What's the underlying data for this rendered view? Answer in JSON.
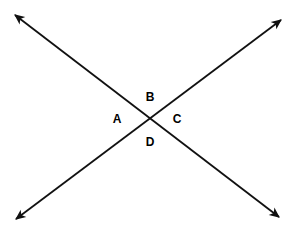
{
  "canvas": {
    "width": 296,
    "height": 237,
    "background_color": "#ffffff"
  },
  "figure": {
    "stroke_color": "#111111",
    "stroke_width": 1.8,
    "intersection": {
      "x": 148,
      "y": 117
    },
    "lines": [
      {
        "id": "line-falling",
        "name": "line-top-left-to-bottom-right",
        "from": {
          "x": 15,
          "y": 15
        },
        "to": {
          "x": 279,
          "y": 217
        },
        "arrowhead_start": true,
        "arrowhead_end": true
      },
      {
        "id": "line-rising",
        "name": "line-bottom-left-to-top-right",
        "from": {
          "x": 16,
          "y": 219
        },
        "to": {
          "x": 281,
          "y": 20
        },
        "arrowhead_start": true,
        "arrowhead_end": true
      }
    ],
    "arrow_tips": [
      {
        "name": "arrow-tip-top-left",
        "x": 15,
        "y": 15
      },
      {
        "name": "arrow-tip-top-right",
        "x": 281,
        "y": 20
      },
      {
        "name": "arrow-tip-bottom-left",
        "x": 16,
        "y": 219
      },
      {
        "name": "arrow-tip-bottom-right",
        "x": 279,
        "y": 217
      }
    ],
    "labels": [
      {
        "id": "A",
        "text": "A",
        "x": 117,
        "y": 119,
        "position": "left-angle"
      },
      {
        "id": "B",
        "text": "B",
        "x": 150,
        "y": 97,
        "position": "top-angle"
      },
      {
        "id": "C",
        "text": "C",
        "x": 177,
        "y": 119,
        "position": "right-angle"
      },
      {
        "id": "D",
        "text": "D",
        "x": 150,
        "y": 142,
        "position": "bottom-angle"
      }
    ]
  }
}
